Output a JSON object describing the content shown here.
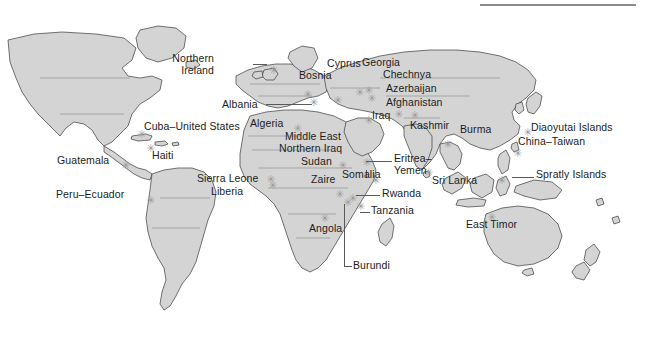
{
  "figure": {
    "type": "world-map",
    "title": "",
    "background_color": "#ffffff",
    "land_color": "#d4d4d4",
    "land_outline_color": "#3a3a3a",
    "ocean_color": "#ffffff",
    "label_color": "#1c1c1c",
    "marker_color": "#9a9a9a",
    "marker_glyph": "✳",
    "rule_color": "#8a8a8a"
  },
  "labels": [
    {
      "name": "northern-ireland",
      "text_line1": "Northern",
      "text_line2": "Ireland",
      "x": 214,
      "y": 40,
      "align": "right"
    },
    {
      "name": "bosnia",
      "text_line1": "Bosnia",
      "text_line2": "",
      "x": 299,
      "y": 57,
      "align": "left"
    },
    {
      "name": "cyprus",
      "text_line1": "Cyprus",
      "text_line2": "",
      "x": 327,
      "y": 45,
      "align": "left"
    },
    {
      "name": "georgia",
      "text_line1": "Georgia",
      "text_line2": "",
      "x": 362,
      "y": 44,
      "align": "left"
    },
    {
      "name": "chechnya",
      "text_line1": "Chechnya",
      "text_line2": "",
      "x": 383,
      "y": 56,
      "align": "left"
    },
    {
      "name": "azerbaijan",
      "text_line1": "Azerbaijan",
      "text_line2": "",
      "x": 386,
      "y": 70,
      "align": "left"
    },
    {
      "name": "afghanistan",
      "text_line1": "Afghanistan",
      "text_line2": "",
      "x": 386,
      "y": 84,
      "align": "left"
    },
    {
      "name": "albania",
      "text_line1": "Albania",
      "text_line2": "",
      "x": 227,
      "y": 81,
      "align": "left"
    },
    {
      "name": "iraq",
      "text_line1": "Iraq",
      "text_line2": "",
      "x": 371,
      "y": 97,
      "align": "left"
    },
    {
      "name": "kashmir",
      "text_line1": "Kashmir",
      "text_line2": "",
      "x": 412,
      "y": 107,
      "align": "left"
    },
    {
      "name": "burma",
      "text_line1": "Burma",
      "text_line2": "",
      "x": 462,
      "y": 111,
      "align": "left"
    },
    {
      "name": "diaoyutai-islands",
      "text_line1": "Diaoyutai Islands",
      "text_line2": "",
      "x": 530,
      "y": 108,
      "align": "left"
    },
    {
      "name": "china-taiwan",
      "text_line1": "China–Taiwan",
      "text_line2": "",
      "x": 518,
      "y": 122,
      "align": "left"
    },
    {
      "name": "algeria",
      "text_line1": "Algeria",
      "text_line2": "",
      "x": 250,
      "y": 104,
      "align": "left"
    },
    {
      "name": "cuba-united-states",
      "text_line1": "Cuba–United States",
      "text_line2": "",
      "x": 144,
      "y": 108,
      "align": "left"
    },
    {
      "name": "middle-east",
      "text_line1": "Middle East",
      "text_line2": "",
      "x": 285,
      "y": 118,
      "align": "left"
    },
    {
      "name": "northern-iraq",
      "text_line1": "Northern Iraq",
      "text_line2": "",
      "x": 281,
      "y": 130,
      "align": "left"
    },
    {
      "name": "haiti",
      "text_line1": "Haiti",
      "text_line2": "",
      "x": 152,
      "y": 137,
      "align": "left"
    },
    {
      "name": "sudan",
      "text_line1": "Sudan",
      "text_line2": "",
      "x": 303,
      "y": 143,
      "align": "left"
    },
    {
      "name": "eritrea-yemen",
      "text_line1": "Eritrea–",
      "text_line2": "Yemen",
      "x": 392,
      "y": 140,
      "align": "left"
    },
    {
      "name": "sri-lanka",
      "text_line1": "Sri Lanka",
      "text_line2": "",
      "x": 434,
      "y": 161,
      "align": "left"
    },
    {
      "name": "spratly-islands",
      "text_line1": "Spratly Islands",
      "text_line2": "",
      "x": 535,
      "y": 155,
      "align": "left"
    },
    {
      "name": "guatemala",
      "text_line1": "Guatemala",
      "text_line2": "",
      "x": 59,
      "y": 141,
      "align": "left"
    },
    {
      "name": "sierra-leone",
      "text_line1": "Sierra Leone",
      "text_line2": "",
      "x": 199,
      "y": 159,
      "align": "left"
    },
    {
      "name": "zaire",
      "text_line1": "Zaire",
      "text_line2": "",
      "x": 313,
      "y": 160,
      "align": "left"
    },
    {
      "name": "somalia",
      "text_line1": "Somalia",
      "text_line2": "",
      "x": 344,
      "y": 155,
      "align": "left"
    },
    {
      "name": "liberia",
      "text_line1": "Liberia",
      "text_line2": "",
      "x": 212,
      "y": 173,
      "align": "left"
    },
    {
      "name": "rwanda",
      "text_line1": "Rwanda",
      "text_line2": "",
      "x": 381,
      "y": 173,
      "align": "left"
    },
    {
      "name": "peru-ecuador",
      "text_line1": "Peru–Ecuador",
      "text_line2": "",
      "x": 57,
      "y": 175,
      "align": "left"
    },
    {
      "name": "tanzania",
      "text_line1": "Tanzania",
      "text_line2": "",
      "x": 371,
      "y": 190,
      "align": "left"
    },
    {
      "name": "angola",
      "text_line1": "Angola",
      "text_line2": "",
      "x": 311,
      "y": 209,
      "align": "left"
    },
    {
      "name": "east-timor",
      "text_line1": "East Timor",
      "text_line2": "",
      "x": 468,
      "y": 205,
      "align": "left"
    },
    {
      "name": "burundi",
      "text_line1": "Burundi",
      "text_line2": "",
      "x": 352,
      "y": 245,
      "align": "left"
    }
  ],
  "markers": [
    {
      "name": "marker-northern-ireland",
      "x": 269,
      "y": 48
    },
    {
      "name": "marker-bosnia",
      "x": 303,
      "y": 72
    },
    {
      "name": "marker-cyprus",
      "x": 333,
      "y": 78
    },
    {
      "name": "marker-georgia",
      "x": 355,
      "y": 70
    },
    {
      "name": "marker-chechnya",
      "x": 364,
      "y": 68
    },
    {
      "name": "marker-azerbaijan",
      "x": 367,
      "y": 76
    },
    {
      "name": "marker-afghanistan",
      "x": 394,
      "y": 92
    },
    {
      "name": "marker-albania",
      "x": 309,
      "y": 80
    },
    {
      "name": "marker-iraq",
      "x": 364,
      "y": 98
    },
    {
      "name": "marker-kashmir",
      "x": 410,
      "y": 93
    },
    {
      "name": "marker-burma",
      "x": 443,
      "y": 122
    },
    {
      "name": "marker-diaoyutai",
      "x": 523,
      "y": 110
    },
    {
      "name": "marker-china-taiwan",
      "x": 513,
      "y": 131
    },
    {
      "name": "marker-algeria",
      "x": 293,
      "y": 106
    },
    {
      "name": "marker-cuba",
      "x": 137,
      "y": 112
    },
    {
      "name": "marker-haiti",
      "x": 146,
      "y": 126
    },
    {
      "name": "marker-sudan",
      "x": 338,
      "y": 143
    },
    {
      "name": "marker-eritrea-yemen",
      "x": 362,
      "y": 140
    },
    {
      "name": "marker-sri-lanka",
      "x": 424,
      "y": 150
    },
    {
      "name": "marker-spratly",
      "x": 497,
      "y": 158
    },
    {
      "name": "marker-sierra-leone",
      "x": 266,
      "y": 157
    },
    {
      "name": "marker-liberia",
      "x": 268,
      "y": 163
    },
    {
      "name": "marker-somalia",
      "x": 371,
      "y": 158
    },
    {
      "name": "marker-zaire",
      "x": 335,
      "y": 172
    },
    {
      "name": "marker-rwanda",
      "x": 348,
      "y": 176
    },
    {
      "name": "marker-tanzania",
      "x": 356,
      "y": 184
    },
    {
      "name": "marker-burundi",
      "x": 343,
      "y": 180
    },
    {
      "name": "marker-angola",
      "x": 320,
      "y": 196
    },
    {
      "name": "marker-peru-ecuador",
      "x": 146,
      "y": 178
    },
    {
      "name": "marker-east-timor",
      "x": 487,
      "y": 195
    },
    {
      "name": "marker-guatemala",
      "x": 121,
      "y": 143
    }
  ],
  "leaders": [
    {
      "name": "leader-albania",
      "x": 266,
      "y": 86,
      "width": 46
    },
    {
      "name": "leader-eritrea-yemen",
      "x": 366,
      "y": 143,
      "width": 26
    },
    {
      "name": "leader-rwanda",
      "x": 356,
      "y": 177,
      "width": 24
    },
    {
      "name": "leader-tanzania",
      "x": 360,
      "y": 194,
      "width": 10
    },
    {
      "name": "leader-northern-ireland",
      "x": 253,
      "y": 46,
      "width": 14
    },
    {
      "name": "leader-spratly",
      "x": 512,
      "y": 159,
      "width": 22
    }
  ]
}
